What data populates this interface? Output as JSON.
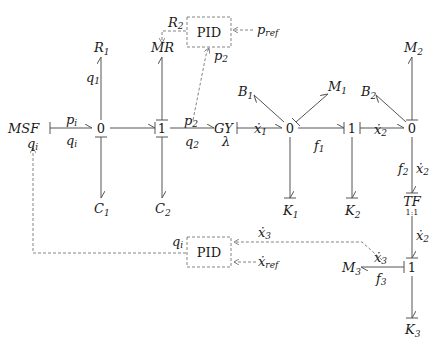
{
  "diagram": {
    "type": "bond-graph",
    "elements": {
      "msf": "MSF",
      "msf_signal": "q",
      "msf_signal_sub": "i",
      "j0a": "0",
      "j1a": "1",
      "gy": "GY",
      "gy_param": "λ",
      "j0b": "0",
      "j1b": "1",
      "j0c": "0",
      "j1c": "1",
      "tf": "TF",
      "tf_ratio": "1:1",
      "r1": "R",
      "r1_sub": "1",
      "mr": "MR",
      "c1": "C",
      "c1_sub": "1",
      "c2": "C",
      "c2_sub": "2",
      "b1": "B",
      "b1_sub": "1",
      "m1": "M",
      "m1_sub": "1",
      "b2": "B",
      "b2_sub": "2",
      "m2": "M",
      "m2_sub": "2",
      "k1": "K",
      "k1_sub": "1",
      "k2": "K",
      "k2_sub": "2",
      "m3": "M",
      "m3_sub": "3",
      "k3": "K",
      "k3_sub": "3"
    },
    "bond_labels": {
      "pi": "p",
      "pi_sub": "i",
      "qi": "q",
      "qi_sub": "i",
      "q1": "q",
      "q1_sub": "1",
      "p2": "p",
      "p2_sub": "2",
      "q2": "q",
      "q2_sub": "2",
      "x1dot": "ẋ",
      "x1dot_sub": "1",
      "f1": "f",
      "f1_sub": "1",
      "x2dot_h": "ẋ",
      "x2dot_h_sub": "2",
      "f2": "f",
      "f2_sub": "2",
      "x2dot_v": "ẋ",
      "x2dot_v_sub": "2",
      "x2dot_tf": "ẋ",
      "x2dot_tf_sub": "2",
      "x3dot": "ẋ",
      "x3dot_sub": "3",
      "f3": "f",
      "f3_sub": "3"
    },
    "controllers": {
      "pid_top": {
        "label": "PID",
        "output": "R",
        "output_sub": "2",
        "input_ref": "p",
        "input_ref_sub": "ref",
        "input_fb": "p",
        "input_fb_sub": "2"
      },
      "pid_bottom": {
        "label": "PID",
        "output": "q",
        "output_sub": "i",
        "input_fb": "ẋ",
        "input_fb_sub": "3",
        "input_ref": "ẋ",
        "input_ref_sub": "ref"
      }
    }
  }
}
